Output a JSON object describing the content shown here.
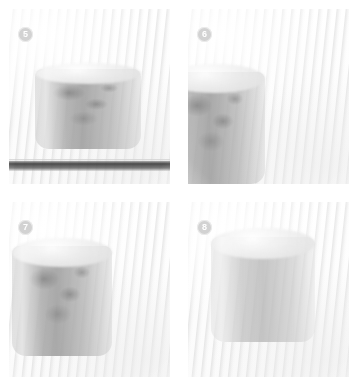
{
  "figure": {
    "layout": "2x2 grid",
    "width": 358,
    "height": 386,
    "background_color": "#ffffff",
    "style": "grayscale photograph panels"
  },
  "badge_style": {
    "background_color": "#d2d2d2",
    "text_color": "#ffffff",
    "shape": "circle"
  },
  "panels": [
    {
      "number": "5",
      "badge_label": "5",
      "position": "top-left",
      "caption": "Cylindrical specimen resting on a dark flat stage",
      "contents": {
        "specimen": "textured cylinder",
        "instrument_visible": "no",
        "stage_bar_visible": "yes"
      }
    },
    {
      "number": "6",
      "badge_label": "6",
      "position": "top-right",
      "caption": "Instrument with dark angled blade tip held beside the specimen",
      "contents": {
        "specimen": "textured cylinder at left edge",
        "instrument_visible": "yes",
        "stage_bar_visible": "no"
      }
    },
    {
      "number": "7",
      "badge_label": "7",
      "position": "bottom-left",
      "caption": "Blade inserted vertically along the right side of the specimen",
      "contents": {
        "specimen": "textured cylinder",
        "instrument_visible": "yes",
        "stage_bar_visible": "no"
      }
    },
    {
      "number": "8",
      "badge_label": "8",
      "position": "bottom-right",
      "caption": "Cylindrical specimen shown alone after the procedure",
      "contents": {
        "specimen": "smooth cylinder with elliptical top face",
        "instrument_visible": "no",
        "stage_bar_visible": "no"
      }
    }
  ]
}
